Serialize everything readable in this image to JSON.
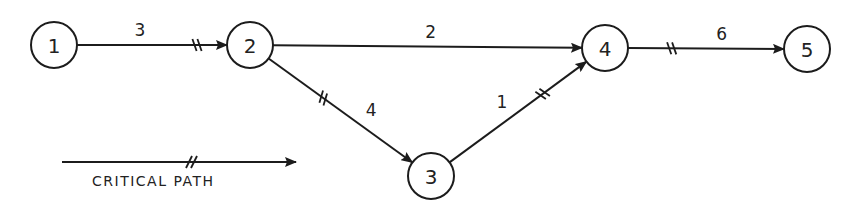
{
  "diagram": {
    "type": "network-activity-diagram",
    "nodes": [
      {
        "id": "1",
        "label": "1",
        "cx": 54,
        "cy": 45,
        "r": 23
      },
      {
        "id": "2",
        "label": "2",
        "cx": 250,
        "cy": 45,
        "r": 23
      },
      {
        "id": "3",
        "label": "3",
        "cx": 431,
        "cy": 176,
        "r": 23
      },
      {
        "id": "4",
        "label": "4",
        "cx": 605,
        "cy": 48,
        "r": 23
      },
      {
        "id": "5",
        "label": "5",
        "cx": 807,
        "cy": 49,
        "r": 23
      }
    ],
    "edges": [
      {
        "from": "1",
        "to": "2",
        "weight": "3",
        "critical": true
      },
      {
        "from": "2",
        "to": "4",
        "weight": "2",
        "critical": false
      },
      {
        "from": "2",
        "to": "3",
        "weight": "4",
        "critical": true
      },
      {
        "from": "3",
        "to": "4",
        "weight": "1",
        "critical": true
      },
      {
        "from": "4",
        "to": "5",
        "weight": "6",
        "critical": true
      }
    ],
    "legend": {
      "label": "CRITICAL PATH",
      "marker": "double-slash-arrow"
    },
    "colors": {
      "ink": "#1c1c1c",
      "background": "#ffffff"
    }
  }
}
